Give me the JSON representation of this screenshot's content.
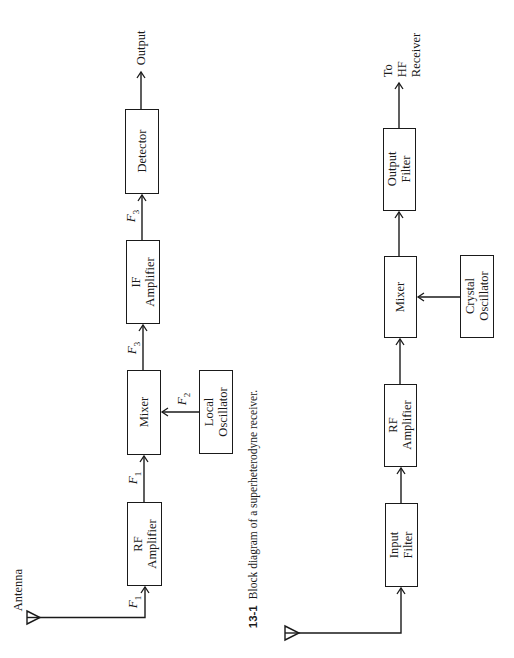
{
  "diagram_top": {
    "title": "Superheterodyne receiver",
    "antenna_label": "Antenna",
    "output_label": "Output",
    "blocks": {
      "rf_amplifier": [
        "RF",
        "Amplifier"
      ],
      "mixer": [
        "Mixer"
      ],
      "local_oscillator": [
        "Local",
        "Oscillator"
      ],
      "if_amplifier": [
        "IF",
        "Amplifier"
      ],
      "detector": [
        "Detector"
      ]
    },
    "signals": {
      "antenna_to_rf": {
        "letter": "F",
        "sub": "1"
      },
      "rf_to_mixer": {
        "letter": "F",
        "sub": "1"
      },
      "lo_to_mixer": {
        "letter": "F",
        "sub": "2"
      },
      "mixer_to_if": {
        "letter": "F",
        "sub": "3"
      },
      "if_to_detector": {
        "letter": "F",
        "sub": "3"
      }
    },
    "caption": {
      "number": "13-1",
      "text": "Block diagram of a superheterodyne receiver."
    }
  },
  "diagram_bottom": {
    "output_label": [
      "To",
      "HF",
      "Receiver"
    ],
    "blocks": {
      "input_filter": [
        "Input",
        "Filter"
      ],
      "rf_amplifier": [
        "RF",
        "Amplifier"
      ],
      "mixer": [
        "Mixer"
      ],
      "crystal_oscillator": [
        "Crystal",
        "Oscillator"
      ],
      "output_filter": [
        "Output",
        "Filter"
      ]
    }
  },
  "colors": {
    "line": "#1a1a1a",
    "background": "#ffffff"
  }
}
